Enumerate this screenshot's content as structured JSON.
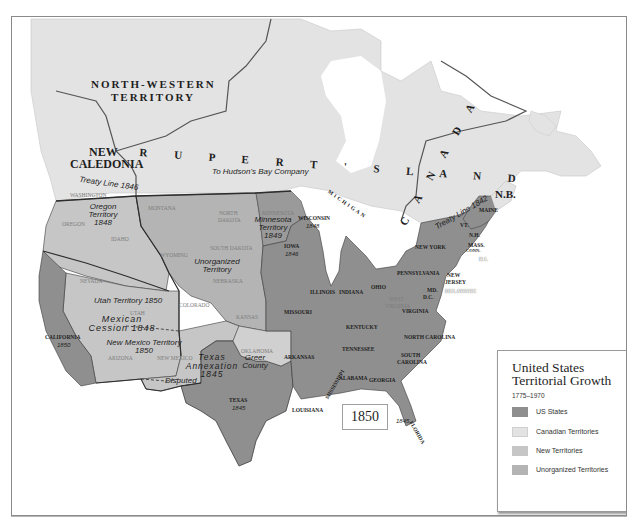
{
  "map": {
    "year": "1850",
    "colors": {
      "us_states": "#8f8f8f",
      "canadian_territories": "#e3e3e3",
      "new_territories": "#c6c6c6",
      "unorganized_territories": "#b4b4b4",
      "water": "#ffffff",
      "border": "#3a3a3a"
    },
    "region_labels": {
      "north_western_territory_1": "NORTH-WESTERN",
      "north_western_territory_2": "TERRITORY",
      "new_caledonia_1": "NEW",
      "new_caledonia_2": "CALEDONIA",
      "ruperts_land": "R U P E R T ' S   L A N D",
      "hudsons_bay": "To Hudson's Bay Company",
      "canada": "C A N A D A",
      "nb": "N.B."
    },
    "annotations": {
      "treaty_line_1846": "Treaty Line 1846",
      "treaty_line_1842": "Treaty Line 1842",
      "oregon_territory": "Oregon Territory 1848",
      "minnesota_territory": "Minnesota Territory 1849",
      "unorganized_territory": "Unorganized Territory",
      "utah_territory": "Utah Territory 1850",
      "mexican_cession": "Mexican Cession 1848",
      "new_mexico_territory": "New Mexico Territory 1850",
      "texas_annexation": "Texas Annexation 1845",
      "disputed": "Disputed",
      "greer_county": "Greer County"
    },
    "states": {
      "california": "CALIFORNIA",
      "california_year": "1850",
      "texas": "TEXAS",
      "texas_year": "1845",
      "iowa": "IOWA",
      "iowa_year": "1846",
      "wisconsin": "WISCONSIN",
      "wisconsin_year": "1848",
      "florida": "FLORIDA",
      "florida_year": "1845",
      "michigan": "MICHIGAN",
      "missouri": "MISSOURI",
      "arkansas": "ARKANSAS",
      "louisiana": "LOUISIANA",
      "illinois": "ILLINOIS",
      "indiana": "INDIANA",
      "ohio": "OHIO",
      "kentucky": "KENTUCKY",
      "tennessee": "TENNESSEE",
      "mississippi": "MISSISSIPPI",
      "alabama": "ALABAMA",
      "georgia": "GEORGIA",
      "south_carolina_1": "SOUTH",
      "south_carolina_2": "CAROLINA",
      "north_carolina": "NORTH CAROLINA",
      "virginia": "VIRGINIA",
      "pennsylvania": "PENNSYLVANIA",
      "new_york": "NEW YORK",
      "new_jersey_1": "NEW",
      "new_jersey_2": "JERSEY",
      "delaware": "DELAWARE",
      "maryland": "MD.",
      "dc": "D.C.",
      "vermont": "VT.",
      "new_hampshire": "N.H.",
      "massachusetts": "MASS.",
      "connecticut": "CONN.",
      "rhode_island": "R.I.",
      "maine": "MAINE"
    },
    "future_states": {
      "washington": "WASHINGTON",
      "oregon": "OREGON",
      "idaho": "IDAHO",
      "montana": "MONTANA",
      "wyoming": "WYOMING",
      "north_dakota_1": "NORTH",
      "north_dakota_2": "DAKOTA",
      "south_dakota": "SOUTH DAKOTA",
      "minnesota": "MINNESOTA",
      "nebraska": "NEBRASKA",
      "kansas": "KANSAS",
      "colorado": "COLORADO",
      "nevada": "NEVADA",
      "utah": "UTAH",
      "arizona": "ARIZONA",
      "new_mexico": "NEW MEXICO",
      "oklahoma": "OKLAHOMA",
      "west_virginia_1": "WEST",
      "west_virginia_2": "VIRGINIA"
    }
  },
  "legend": {
    "title_line1": "United States",
    "title_line2": "Territorial Growth",
    "range": "1775–1970",
    "items": [
      {
        "label": "US States",
        "color": "#8f8f8f"
      },
      {
        "label": "Canadian Territories",
        "color": "#e3e3e3"
      },
      {
        "label": "New Territories",
        "color": "#c6c6c6"
      },
      {
        "label": "Unorganized Territories",
        "color": "#b4b4b4"
      }
    ]
  }
}
